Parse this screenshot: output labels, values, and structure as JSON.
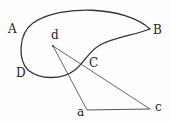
{
  "diagram": {
    "labels": {
      "A": "A",
      "B": "B",
      "C": "C",
      "D": "D",
      "a": "a",
      "c": "c",
      "d": "d"
    },
    "stroke_color": "#333333",
    "curve_description": "Closed teardrop curve through A, B, C, D",
    "lines": [
      {
        "from": "d",
        "to": "a"
      },
      {
        "from": "d",
        "to": "c"
      },
      {
        "from": "a",
        "to": "c"
      }
    ]
  }
}
